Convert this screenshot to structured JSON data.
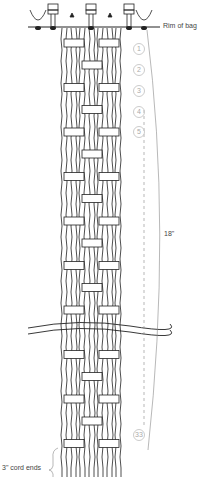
{
  "labels": {
    "rim": "Rim of bag",
    "length": "18\"",
    "cord_ends": "3\" cord ends"
  },
  "row_numbers": [
    "1",
    "2",
    "3",
    "4",
    "5",
    "33"
  ],
  "colors": {
    "line": "#222222",
    "guide": "#888888",
    "number": "#aaaaaa"
  }
}
